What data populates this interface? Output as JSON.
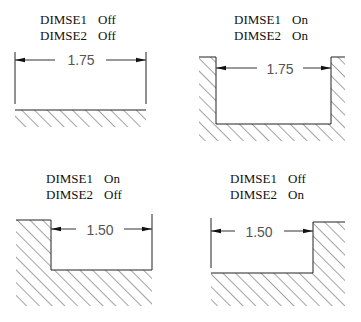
{
  "diagram": {
    "panels": [
      {
        "id": "top-left",
        "dimse1_label": "DIMSE1",
        "dimse1_value": "Off",
        "dimse2_label": "DIMSE2",
        "dimse2_value": "Off",
        "dimension_text": "1.75"
      },
      {
        "id": "top-right",
        "dimse1_label": "DIMSE1",
        "dimse1_value": "On",
        "dimse2_label": "DIMSE2",
        "dimse2_value": "On",
        "dimension_text": "1.75"
      },
      {
        "id": "bottom-left",
        "dimse1_label": "DIMSE1",
        "dimse1_value": "On",
        "dimse2_label": "DIMSE2",
        "dimse2_value": "Off",
        "dimension_text": "1.50"
      },
      {
        "id": "bottom-right",
        "dimse1_label": "DIMSE1",
        "dimse1_value": "Off",
        "dimse2_label": "DIMSE2",
        "dimse2_value": "On",
        "dimension_text": "1.50"
      }
    ],
    "colors": {
      "line": "#222222",
      "dimension_text": "#555555",
      "label_text": "#111111",
      "background": "#ffffff"
    }
  }
}
